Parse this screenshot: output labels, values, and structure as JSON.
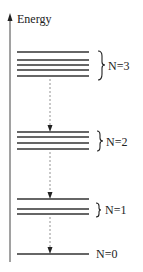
{
  "axis": {
    "label": "Energy",
    "color": "#333333"
  },
  "levels": [
    {
      "label": "N=3",
      "lines_y": [
        52,
        60,
        65,
        70,
        76
      ],
      "brace": {
        "y1": 50,
        "y2": 80
      },
      "label_y": 69
    },
    {
      "label": "N=2",
      "lines_y": [
        132,
        137,
        143,
        149
      ],
      "brace": {
        "y1": 130,
        "y2": 151
      },
      "label_y": 146
    },
    {
      "label": "N=1",
      "lines_y": [
        199,
        209,
        214
      ],
      "brace": {
        "y1": 203,
        "y2": 217
      },
      "label_y": 214
    },
    {
      "label": "N=0",
      "lines_y": [
        254
      ],
      "brace": null,
      "label_y": 258
    }
  ],
  "transitions": [
    {
      "from": "N=3",
      "to": "N=2"
    },
    {
      "from": "N=2",
      "to": "N=1"
    },
    {
      "from": "N=1",
      "to": "N=0"
    }
  ],
  "colors": {
    "line": "#333333",
    "dashed": "#777777",
    "text": "#222222"
  }
}
